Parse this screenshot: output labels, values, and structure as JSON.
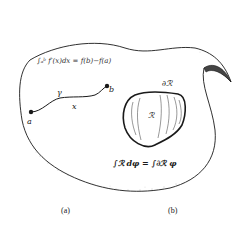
{
  "figure": {
    "part_a": {
      "formula": "∫ₐᵇ f′(x)dx = f(b)−f(a)",
      "endpoint_start": "a",
      "endpoint_end": "b",
      "curve_label": "γ",
      "variable_label": "x"
    },
    "part_b": {
      "region_label": "ℛ",
      "boundary_label": "∂ℛ",
      "formula": "∫ℛ dφ = ∫∂ℛ φ"
    },
    "captions": [
      "(a)",
      "(b)"
    ],
    "colors": {
      "ink": "#1a1a1a",
      "background": "#ffffff",
      "stipple": "#777777"
    }
  }
}
